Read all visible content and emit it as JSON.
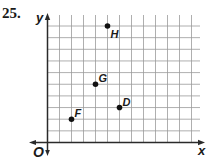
{
  "problem": {
    "number": "25."
  },
  "chart_data": {
    "type": "scatter",
    "title": "",
    "xlabel": "x",
    "ylabel": "y",
    "origin_label": "O",
    "grid": true,
    "xlim": [
      0,
      12
    ],
    "ylim": [
      0,
      10
    ],
    "tick_labels": false,
    "points": [
      {
        "label": "F",
        "x": 2,
        "y": 2
      },
      {
        "label": "G",
        "x": 4,
        "y": 5
      },
      {
        "label": "D",
        "x": 6,
        "y": 3
      },
      {
        "label": "H",
        "x": 5,
        "y": 10
      }
    ]
  },
  "colors": {
    "grid": "#9a9a9a",
    "axis": "#2a2a2a",
    "point": "#111111",
    "text": "#1a1a1a"
  }
}
